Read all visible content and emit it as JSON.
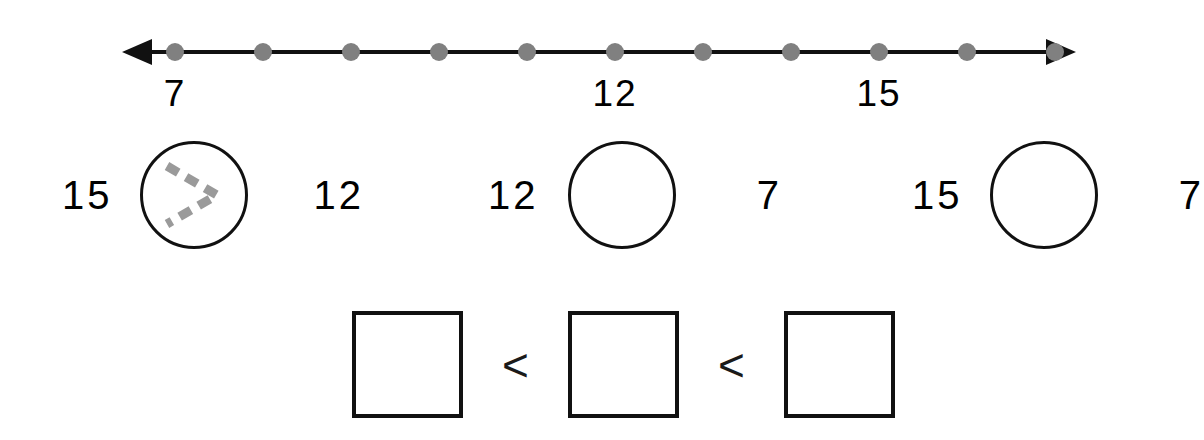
{
  "worksheet": {
    "background_color": "#ffffff",
    "ink_color": "#000000",
    "trace_color": "#9a9a9a",
    "dot_color": "#808080"
  },
  "number_line": {
    "name": "number-line",
    "start_value": 7,
    "end_value": 17,
    "tick_count": 11,
    "tick_values": [
      7,
      8,
      9,
      10,
      11,
      12,
      13,
      14,
      15,
      16,
      17
    ],
    "left_arrow": "◀",
    "right_arrow": "▶",
    "labels": [
      {
        "text": "7",
        "value": 7,
        "tick_index": 0
      },
      {
        "text": "12",
        "value": 12,
        "tick_index": 5
      },
      {
        "text": "15",
        "value": 15,
        "tick_index": 8
      }
    ]
  },
  "comparisons": {
    "name": "comparison-problems",
    "items": [
      {
        "left": "15",
        "right": "12",
        "answer": ">",
        "traced": true,
        "trace_style": "dashed"
      },
      {
        "left": "12",
        "right": "7",
        "answer": "",
        "traced": false,
        "trace_style": "none"
      },
      {
        "left": "15",
        "right": "7",
        "answer": "",
        "traced": false,
        "trace_style": "none"
      }
    ]
  },
  "ordering": {
    "name": "ordering-problem",
    "boxes": [
      "",
      "",
      ""
    ],
    "operators": [
      "<",
      "<"
    ]
  }
}
